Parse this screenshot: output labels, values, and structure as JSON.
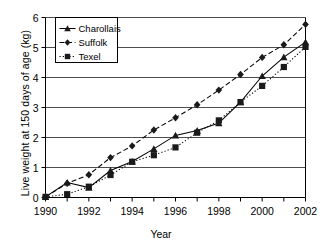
{
  "chart_data": {
    "type": "line",
    "title": "",
    "xlabel": "Year",
    "ylabel": "Live weight at 150 days of age (kg)",
    "x": [
      1990,
      1991,
      1992,
      1993,
      1994,
      1995,
      1996,
      1997,
      1998,
      1999,
      2000,
      2001,
      2002
    ],
    "xlim": [
      1990,
      2002
    ],
    "ylim": [
      0,
      6
    ],
    "xticks": [
      "1990",
      "1992",
      "1994",
      "1996",
      "1998",
      "2000",
      "2002"
    ],
    "yticks": [
      "0",
      "1",
      "2",
      "3",
      "4",
      "5",
      "6"
    ],
    "grid": "horizontal",
    "legend_position": "upper-left-inside",
    "series": [
      {
        "name": "Charollais",
        "marker": "triangle",
        "linestyle": "solid",
        "color": "#000000",
        "values": [
          0.02,
          0.5,
          0.33,
          0.9,
          1.2,
          1.62,
          2.07,
          2.23,
          2.48,
          3.18,
          4.05,
          4.68,
          5.18
        ]
      },
      {
        "name": "Suffolk",
        "marker": "diamond",
        "linestyle": "dashed",
        "color": "#000000",
        "values": [
          0.02,
          0.47,
          0.76,
          1.33,
          1.72,
          2.25,
          2.66,
          3.09,
          3.58,
          4.1,
          4.67,
          5.09,
          5.77
        ]
      },
      {
        "name": "Texel",
        "marker": "square",
        "linestyle": "dotted",
        "color": "#000000",
        "values": [
          0.02,
          0.11,
          0.36,
          0.75,
          1.19,
          1.41,
          1.67,
          2.16,
          2.57,
          3.18,
          3.72,
          4.35,
          5.02
        ]
      }
    ]
  },
  "axis": {
    "ylabel": "Live weight at 150 days of age (kg)",
    "xlabel": "Year"
  },
  "legend": {
    "items": [
      {
        "label": "Charollais"
      },
      {
        "label": "Suffolk"
      },
      {
        "label": "Texel"
      }
    ]
  }
}
